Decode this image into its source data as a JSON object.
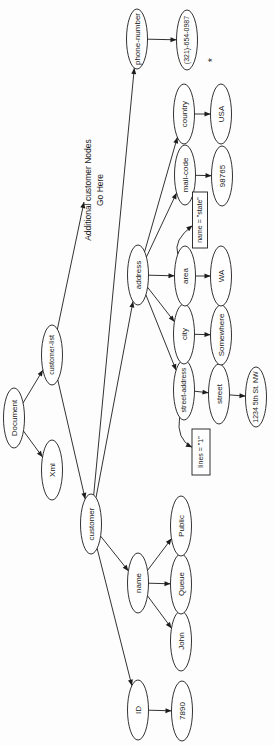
{
  "diagram": {
    "title_semantic": "xml-dom-tree",
    "colors": {
      "background": "#fdfdfd",
      "node_fill": "#ffffff",
      "stroke": "#1c1c1c",
      "text": "#1a1a1a",
      "footnote": "#555555"
    },
    "canvas": {
      "width": 745,
      "height": 274,
      "rotation_deg": -90
    },
    "node_defaults": {
      "rx": 30,
      "ry": 10.5
    },
    "nodes": [
      {
        "id": "document",
        "label": "Document",
        "shape": "ellipse",
        "x": 327,
        "y": 14
      },
      {
        "id": "xml",
        "label": "Xml",
        "shape": "ellipse",
        "x": 275,
        "y": 52
      },
      {
        "id": "customer-list",
        "label": "customer-list",
        "shape": "ellipse",
        "x": 390,
        "y": 52
      },
      {
        "id": "customer",
        "label": "customer",
        "shape": "ellipse",
        "x": 221,
        "y": 91
      },
      {
        "id": "id",
        "label": "ID",
        "shape": "ellipse",
        "x": 35,
        "y": 138
      },
      {
        "id": "name",
        "label": "name",
        "shape": "ellipse",
        "x": 162,
        "y": 138
      },
      {
        "id": "address",
        "label": "address",
        "shape": "ellipse",
        "x": 470,
        "y": 138
      },
      {
        "id": "phone-number",
        "label": "phone-number",
        "shape": "ellipse",
        "x": 706,
        "y": 137
      },
      {
        "id": "id-value",
        "label": "7890",
        "shape": "ellipse",
        "x": 34,
        "y": 182
      },
      {
        "id": "first-name",
        "label": "John",
        "shape": "ellipse",
        "x": 104,
        "y": 181
      },
      {
        "id": "middle-name",
        "label": "Queue",
        "shape": "ellipse",
        "x": 161,
        "y": 181
      },
      {
        "id": "last-name",
        "label": "Public",
        "shape": "ellipse",
        "x": 219,
        "y": 181
      },
      {
        "id": "street-address",
        "label": "street-address",
        "shape": "ellipse",
        "x": 355,
        "y": 184
      },
      {
        "id": "city",
        "label": "city",
        "shape": "ellipse",
        "x": 411,
        "y": 184
      },
      {
        "id": "area",
        "label": "area",
        "shape": "ellipse",
        "x": 469,
        "y": 185
      },
      {
        "id": "mail-code",
        "label": "mail-code",
        "shape": "ellipse",
        "x": 570,
        "y": 185
      },
      {
        "id": "country",
        "label": "country",
        "shape": "ellipse",
        "x": 631,
        "y": 184
      },
      {
        "id": "phone-value",
        "label": "(321)-654-0987",
        "shape": "ellipse",
        "x": 705,
        "y": 187
      },
      {
        "id": "lines-attr",
        "label": "lines = \"1\"",
        "shape": "box",
        "x": 293,
        "y": 201,
        "w": 46,
        "h": 18
      },
      {
        "id": "state-attr",
        "label": "name = \"state\"",
        "shape": "box",
        "x": 525,
        "y": 200,
        "w": 56,
        "h": 15
      },
      {
        "id": "street",
        "label": "street",
        "shape": "ellipse",
        "x": 351,
        "y": 219
      },
      {
        "id": "city-value",
        "label": "Somewhere",
        "shape": "ellipse",
        "x": 410,
        "y": 221
      },
      {
        "id": "area-value",
        "label": "WA",
        "shape": "ellipse",
        "x": 469,
        "y": 221
      },
      {
        "id": "mail-code-value",
        "label": "98765",
        "shape": "ellipse",
        "x": 569,
        "y": 222
      },
      {
        "id": "country-value",
        "label": "USA",
        "shape": "ellipse",
        "x": 631,
        "y": 221
      },
      {
        "id": "street-value",
        "label": "1234 5th St. NW",
        "shape": "ellipse",
        "x": 348,
        "y": 256
      },
      {
        "id": "additional-note",
        "shape": "text",
        "x": 555,
        "y": 88,
        "line_gap": 12,
        "lines": [
          "Additional customer Nodes",
          "Go Here"
        ]
      },
      {
        "id": "footnote",
        "shape": "text",
        "x": 685,
        "y": 212,
        "lines": [
          "*"
        ],
        "font": 11,
        "color": "#555555"
      }
    ],
    "edges": [
      {
        "from": "document",
        "to": "xml"
      },
      {
        "from": "document",
        "to": "customer-list"
      },
      {
        "from": "customer-list",
        "to": "customer"
      },
      {
        "from": "customer-list",
        "to": "additional-note",
        "end": [
          543,
          84
        ]
      },
      {
        "from": "customer",
        "to": "id"
      },
      {
        "from": "customer",
        "to": "name"
      },
      {
        "from": "customer",
        "to": "address"
      },
      {
        "from": "customer",
        "to": "phone-number"
      },
      {
        "from": "id",
        "to": "id-value"
      },
      {
        "from": "name",
        "to": "first-name"
      },
      {
        "from": "name",
        "to": "middle-name"
      },
      {
        "from": "name",
        "to": "last-name"
      },
      {
        "from": "address",
        "to": "street-address"
      },
      {
        "from": "address",
        "to": "city"
      },
      {
        "from": "address",
        "to": "area"
      },
      {
        "from": "address",
        "to": "mail-code"
      },
      {
        "from": "address",
        "to": "country"
      },
      {
        "from": "street-address",
        "to": "street"
      },
      {
        "from": "street-address",
        "to": "lines-attr",
        "via": [
          306,
          176
        ]
      },
      {
        "from": "city",
        "to": "city-value"
      },
      {
        "from": "area",
        "to": "area-value"
      },
      {
        "from": "area",
        "to": "state-attr",
        "via": [
          505,
          173
        ]
      },
      {
        "from": "mail-code",
        "to": "mail-code-value"
      },
      {
        "from": "country",
        "to": "country-value"
      },
      {
        "from": "phone-number",
        "to": "phone-value"
      },
      {
        "from": "street",
        "to": "street-value"
      }
    ]
  }
}
